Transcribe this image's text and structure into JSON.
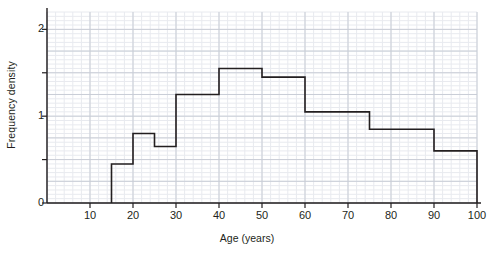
{
  "chart_data": {
    "type": "bar",
    "title": "",
    "subtitle": "",
    "xlabel": "Age (years)",
    "ylabel": "Frequency density",
    "xlim": [
      0,
      100
    ],
    "ylim": [
      0,
      2.2
    ],
    "grid": true,
    "legend": null,
    "histogram": true,
    "bin_edges": [
      15,
      20,
      25,
      30,
      40,
      50,
      60,
      75,
      90,
      100
    ],
    "values": [
      0.45,
      0.8,
      0.65,
      1.25,
      1.55,
      1.45,
      1.05,
      0.85,
      0.6
    ],
    "categories": [
      "15-20",
      "20-25",
      "25-30",
      "30-40",
      "40-50",
      "50-60",
      "60-75",
      "75-90",
      "90-100"
    ],
    "bars": [
      {
        "start": 15,
        "end": 20,
        "density": 0.45
      },
      {
        "start": 20,
        "end": 25,
        "density": 0.8
      },
      {
        "start": 25,
        "end": 30,
        "density": 0.65
      },
      {
        "start": 30,
        "end": 40,
        "density": 1.25
      },
      {
        "start": 40,
        "end": 50,
        "density": 1.55
      },
      {
        "start": 50,
        "end": 60,
        "density": 1.45
      },
      {
        "start": 60,
        "end": 75,
        "density": 1.05
      },
      {
        "start": 75,
        "end": 90,
        "density": 0.85
      },
      {
        "start": 90,
        "end": 100,
        "density": 0.6
      }
    ],
    "x_ticks": [
      10,
      20,
      30,
      40,
      50,
      60,
      70,
      80,
      90,
      100
    ],
    "x_tick_labels": [
      "10",
      "20",
      "30",
      "40",
      "50",
      "60",
      "70",
      "80",
      "90",
      "100"
    ],
    "x_major_step": 10,
    "x_minor_step": 2,
    "y_ticks": [
      0,
      0.5,
      1,
      1.5,
      2
    ],
    "y_tick_labels": [
      "0",
      "",
      "1",
      "",
      "2"
    ],
    "y_major_step": 0.25,
    "y_minor_step": 0.05,
    "colors": {
      "bar_outline": "#231f20",
      "axis": "#231f20",
      "grid_major": "#c9cdd6",
      "grid_minor": "#e8eaef",
      "background": "#ffffff",
      "text": "#231f20"
    }
  }
}
